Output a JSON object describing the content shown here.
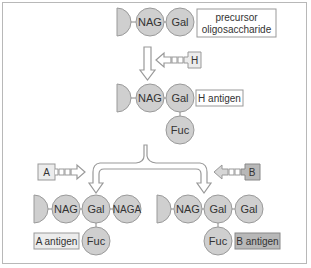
{
  "colors": {
    "sugar_fill": "#cfcfcf",
    "sugar_stroke": "#9a9a9a",
    "box_light": "#ececec",
    "box_dark": "#b8b8b8",
    "line": "#888888"
  },
  "precursor": {
    "sugars": [
      "NAG",
      "Gal"
    ],
    "label_line1": "precursor",
    "label_line2": "oligosaccharide"
  },
  "enzymes": {
    "h": "H",
    "a": "A",
    "b": "B"
  },
  "h_antigen": {
    "sugars": [
      "NAG",
      "Gal",
      "Fuc"
    ],
    "label": "H antigen"
  },
  "a_antigen": {
    "sugars": [
      "NAG",
      "Gal",
      "NAGA",
      "Fuc"
    ],
    "label": "A antigen"
  },
  "b_antigen": {
    "sugars": [
      "NAG",
      "Gal",
      "Gal",
      "Fuc"
    ],
    "label": "B antigen"
  }
}
